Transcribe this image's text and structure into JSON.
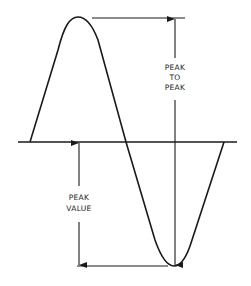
{
  "diagram": {
    "labels": {
      "peak_to_peak": [
        "PEAK",
        "TO",
        "PEAK"
      ],
      "peak_value": [
        "PEAK",
        "VALUE"
      ]
    },
    "colors": {
      "ink": "#1a1a1a",
      "background": "#ffffff"
    }
  }
}
